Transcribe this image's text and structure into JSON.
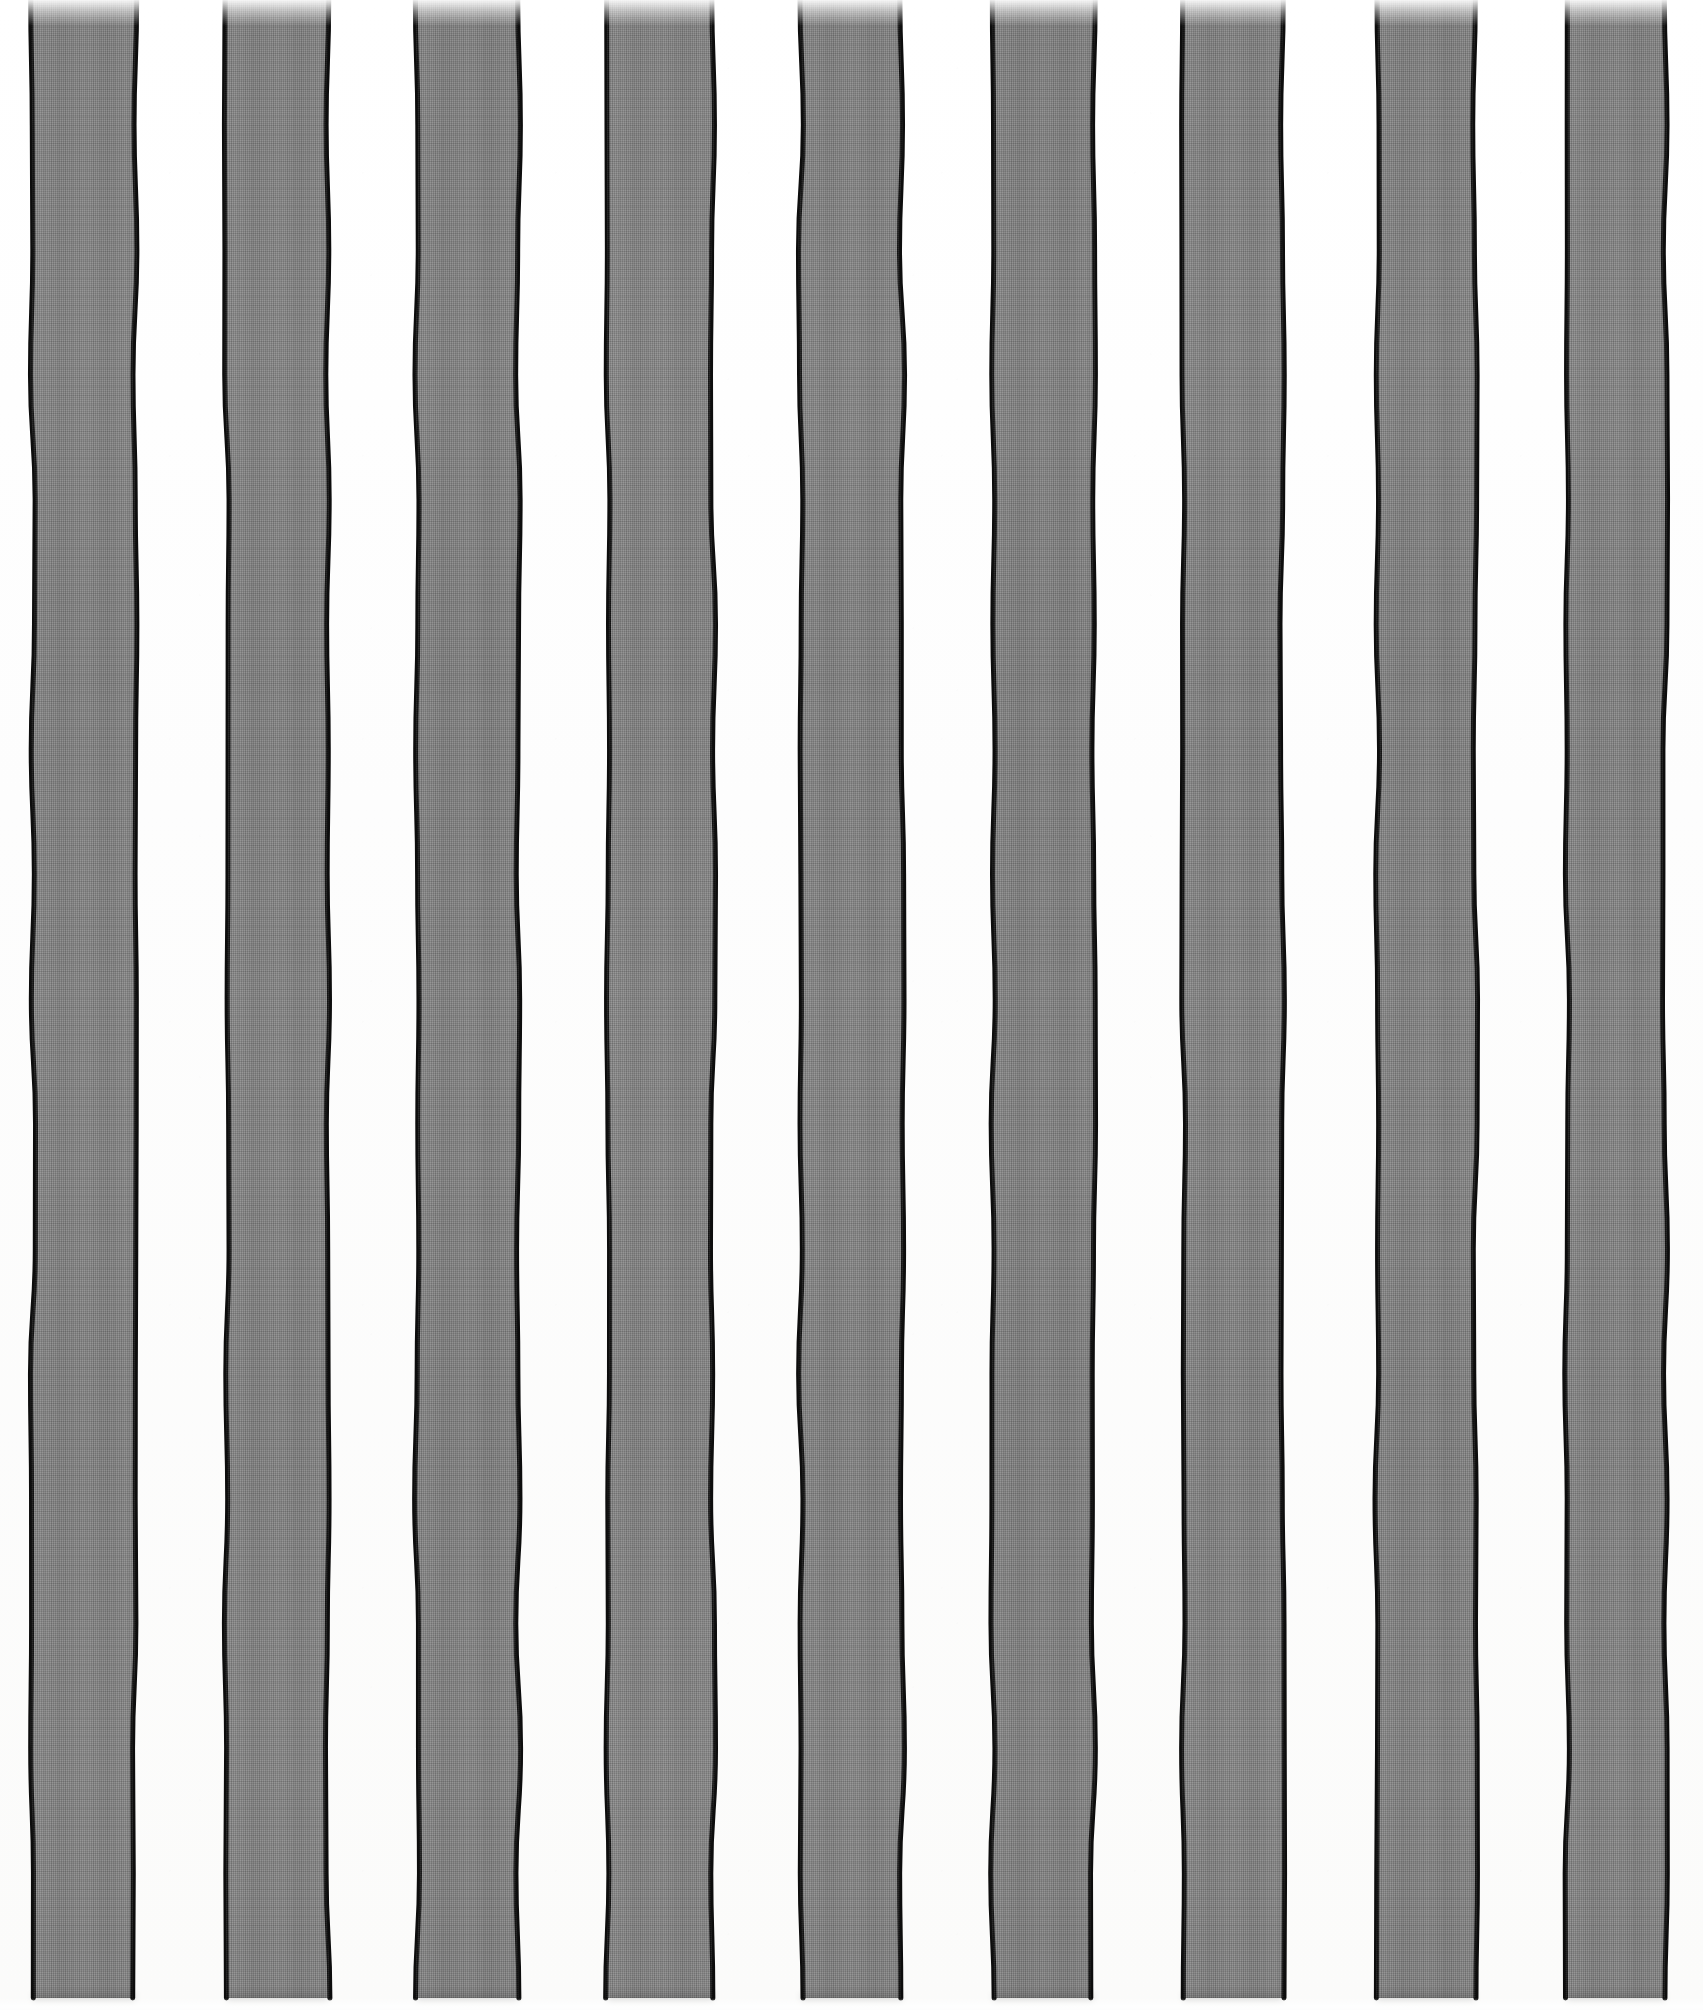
{
  "artwork": {
    "title": "Vertical Striped Canvas",
    "medium_note": "painted gray stripes with hand-drawn black outlines on white ground",
    "canvas_width": 1703,
    "canvas_height": 2010,
    "background_color": "#fdfdfd",
    "stripe_fill_color": "#878787",
    "stripe_outline_color": "#0d0d0d",
    "stripe_count": 9,
    "stripe_top": 0,
    "stripe_bottom": 1998,
    "outline_width": 5,
    "texture": "woven-linen-grid"
  },
  "stripes": [
    {
      "index": 1,
      "label": "stripe-1",
      "x": 33,
      "width": 102,
      "fill": "#878787"
    },
    {
      "index": 2,
      "label": "stripe-2",
      "x": 227,
      "width": 101,
      "fill": "#878787"
    },
    {
      "index": 3,
      "label": "stripe-3",
      "x": 417,
      "width": 101,
      "fill": "#868686"
    },
    {
      "index": 4,
      "label": "stripe-4",
      "x": 608,
      "width": 105,
      "fill": "#888888"
    },
    {
      "index": 5,
      "label": "stripe-5",
      "x": 801,
      "width": 101,
      "fill": "#878787"
    },
    {
      "index": 6,
      "label": "stripe-6",
      "x": 993,
      "width": 100,
      "fill": "#858585"
    },
    {
      "index": 7,
      "label": "stripe-7",
      "x": 1183,
      "width": 99,
      "fill": "#878787"
    },
    {
      "index": 8,
      "label": "stripe-8",
      "x": 1377,
      "width": 98,
      "fill": "#868686"
    },
    {
      "index": 9,
      "label": "stripe-9",
      "x": 1567,
      "width": 98,
      "fill": "#878787"
    }
  ],
  "gaps": [
    {
      "index": 1,
      "label": "gap-1",
      "x": 135,
      "width": 92,
      "fill": "#fdfdfd"
    },
    {
      "index": 2,
      "label": "gap-2",
      "x": 328,
      "width": 89,
      "fill": "#fdfdfd"
    },
    {
      "index": 3,
      "label": "gap-3",
      "x": 518,
      "width": 90,
      "fill": "#fdfdfd"
    },
    {
      "index": 4,
      "label": "gap-4",
      "x": 713,
      "width": 88,
      "fill": "#fdfdfd"
    },
    {
      "index": 5,
      "label": "gap-5",
      "x": 902,
      "width": 91,
      "fill": "#fdfdfd"
    },
    {
      "index": 6,
      "label": "gap-6",
      "x": 1093,
      "width": 90,
      "fill": "#fdfdfd"
    },
    {
      "index": 7,
      "label": "gap-7",
      "x": 1282,
      "width": 95,
      "fill": "#fdfdfd"
    },
    {
      "index": 8,
      "label": "gap-8",
      "x": 1475,
      "width": 92,
      "fill": "#fdfdfd"
    }
  ],
  "margins": {
    "left": 33,
    "right": 38,
    "top": 0,
    "bottom": 12
  }
}
